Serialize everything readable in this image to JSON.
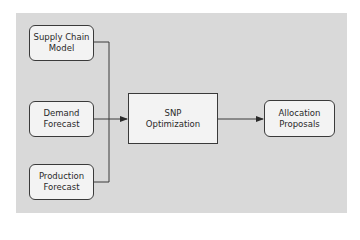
{
  "diagram": {
    "title": "",
    "nodes": [
      {
        "id": "supply_chain_model",
        "line1": "Supply Chain",
        "line2": "Model",
        "shape": "rounded-rect"
      },
      {
        "id": "demand_forecast",
        "line1": "Demand",
        "line2": "Forecast",
        "shape": "rounded-rect"
      },
      {
        "id": "production_forecast",
        "line1": "Production",
        "line2": "Forecast",
        "shape": "rounded-rect"
      },
      {
        "id": "snp_optimization",
        "line1": "SNP",
        "line2": "Optimization",
        "shape": "rect"
      },
      {
        "id": "allocation_proposals",
        "line1": "Allocation",
        "line2": "Proposals",
        "shape": "rounded-rect"
      }
    ],
    "edges": [
      {
        "from": "supply_chain_model",
        "to": "snp_optimization"
      },
      {
        "from": "demand_forecast",
        "to": "snp_optimization"
      },
      {
        "from": "production_forecast",
        "to": "snp_optimization"
      },
      {
        "from": "snp_optimization",
        "to": "allocation_proposals"
      }
    ],
    "colors": {
      "panel_background": "#d9d9d9",
      "box_fill": "#f3f3f3",
      "stroke": "#3a3a3a"
    }
  }
}
